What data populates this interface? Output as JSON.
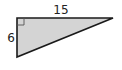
{
  "diagram": {
    "type": "right-triangle",
    "fill_color": "#d4d4d4",
    "stroke_color": "#1a1a1a",
    "labels": {
      "top_side": "15",
      "left_side": "6"
    },
    "right_angle_marker": true
  }
}
